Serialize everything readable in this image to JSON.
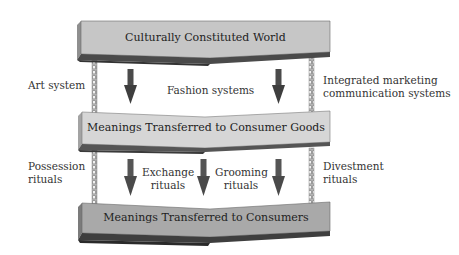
{
  "diagram": {
    "type": "meaning-transfer-flow",
    "colors": {
      "top_box": "#c6c6c6",
      "middle_box": "#d6d6d6",
      "bottom_box": "#a9a9a9",
      "box_edge_dark": "#4a4a4a",
      "arrow": "#4a4a4a",
      "chain": "#8a8a8a"
    },
    "boxes": {
      "top": {
        "label": "Culturally Constituted World"
      },
      "middle": {
        "label": "Meanings Transferred to Consumer Goods"
      },
      "bottom": {
        "label": "Meanings Transferred to Consumers"
      }
    },
    "upper_instruments": {
      "left": {
        "label": "Art system"
      },
      "center": {
        "label": "Fashion systems"
      },
      "right": {
        "line1": "Integrated marketing",
        "line2": "communication systems"
      }
    },
    "lower_instruments": {
      "possession": {
        "line1": "Possession",
        "line2": "rituals"
      },
      "exchange": {
        "line1": "Exchange",
        "line2": "rituals"
      },
      "grooming": {
        "line1": "Grooming",
        "line2": "rituals"
      },
      "divestment": {
        "line1": "Divestment",
        "line2": "rituals"
      }
    }
  }
}
